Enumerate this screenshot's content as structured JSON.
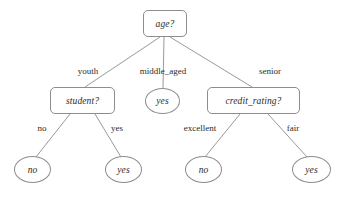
{
  "diagram": {
    "type": "decision-tree",
    "stroke_color": "#8d8d8d",
    "text_color": "#2b2b2b",
    "background_color": "#ffffff",
    "nodes": [
      {
        "id": "root",
        "label": "age?",
        "shape": "rounded-rect",
        "kind": "decision",
        "x": 143,
        "y": 10,
        "w": 44,
        "h": 27
      },
      {
        "id": "student",
        "label": "student?",
        "shape": "rounded-rect",
        "kind": "decision",
        "x": 50,
        "y": 87,
        "w": 65,
        "h": 27
      },
      {
        "id": "mid_yes",
        "label": "yes",
        "shape": "ellipse",
        "kind": "leaf",
        "x": 145,
        "y": 88,
        "w": 35,
        "h": 26
      },
      {
        "id": "credit",
        "label": "credit_rating?",
        "shape": "rounded-rect",
        "kind": "decision",
        "x": 207,
        "y": 87,
        "w": 93,
        "h": 27
      },
      {
        "id": "left_no",
        "label": "no",
        "shape": "ellipse",
        "kind": "leaf",
        "x": 14,
        "y": 156,
        "w": 37,
        "h": 27
      },
      {
        "id": "left_yes",
        "label": "yes",
        "shape": "ellipse",
        "kind": "leaf",
        "x": 105,
        "y": 156,
        "w": 37,
        "h": 27
      },
      {
        "id": "right_no",
        "label": "no",
        "shape": "ellipse",
        "kind": "leaf",
        "x": 185,
        "y": 156,
        "w": 37,
        "h": 27
      },
      {
        "id": "right_yes",
        "label": "yes",
        "shape": "ellipse",
        "kind": "leaf",
        "x": 292,
        "y": 156,
        "w": 39,
        "h": 27
      }
    ],
    "edges": [
      {
        "id": "e-youth",
        "from": "root",
        "to": "student",
        "label": "youth",
        "x1": 160,
        "y1": 37,
        "x2": 85,
        "y2": 87,
        "lx": 88,
        "ly": 71
      },
      {
        "id": "e-middle",
        "from": "root",
        "to": "mid_yes",
        "label": "middle_aged",
        "x1": 164,
        "y1": 37,
        "x2": 163,
        "y2": 88,
        "lx": 163,
        "ly": 71
      },
      {
        "id": "e-senior",
        "from": "root",
        "to": "credit",
        "label": "senior",
        "x1": 170,
        "y1": 37,
        "x2": 252,
        "y2": 87,
        "lx": 270,
        "ly": 71
      },
      {
        "id": "e-no-left",
        "from": "student",
        "to": "left_no",
        "label": "no",
        "x1": 70,
        "y1": 114,
        "x2": 36,
        "y2": 157,
        "lx": 42,
        "ly": 128
      },
      {
        "id": "e-yes-left",
        "from": "student",
        "to": "left_yes",
        "label": "yes",
        "x1": 95,
        "y1": 114,
        "x2": 121,
        "y2": 157,
        "lx": 117,
        "ly": 128
      },
      {
        "id": "e-excellent",
        "from": "credit",
        "to": "right_no",
        "label": "excellent",
        "x1": 240,
        "y1": 114,
        "x2": 205,
        "y2": 157,
        "lx": 200,
        "ly": 128
      },
      {
        "id": "e-fair",
        "from": "credit",
        "to": "right_yes",
        "label": "fair",
        "x1": 268,
        "y1": 114,
        "x2": 307,
        "y2": 157,
        "lx": 293,
        "ly": 128
      }
    ]
  }
}
